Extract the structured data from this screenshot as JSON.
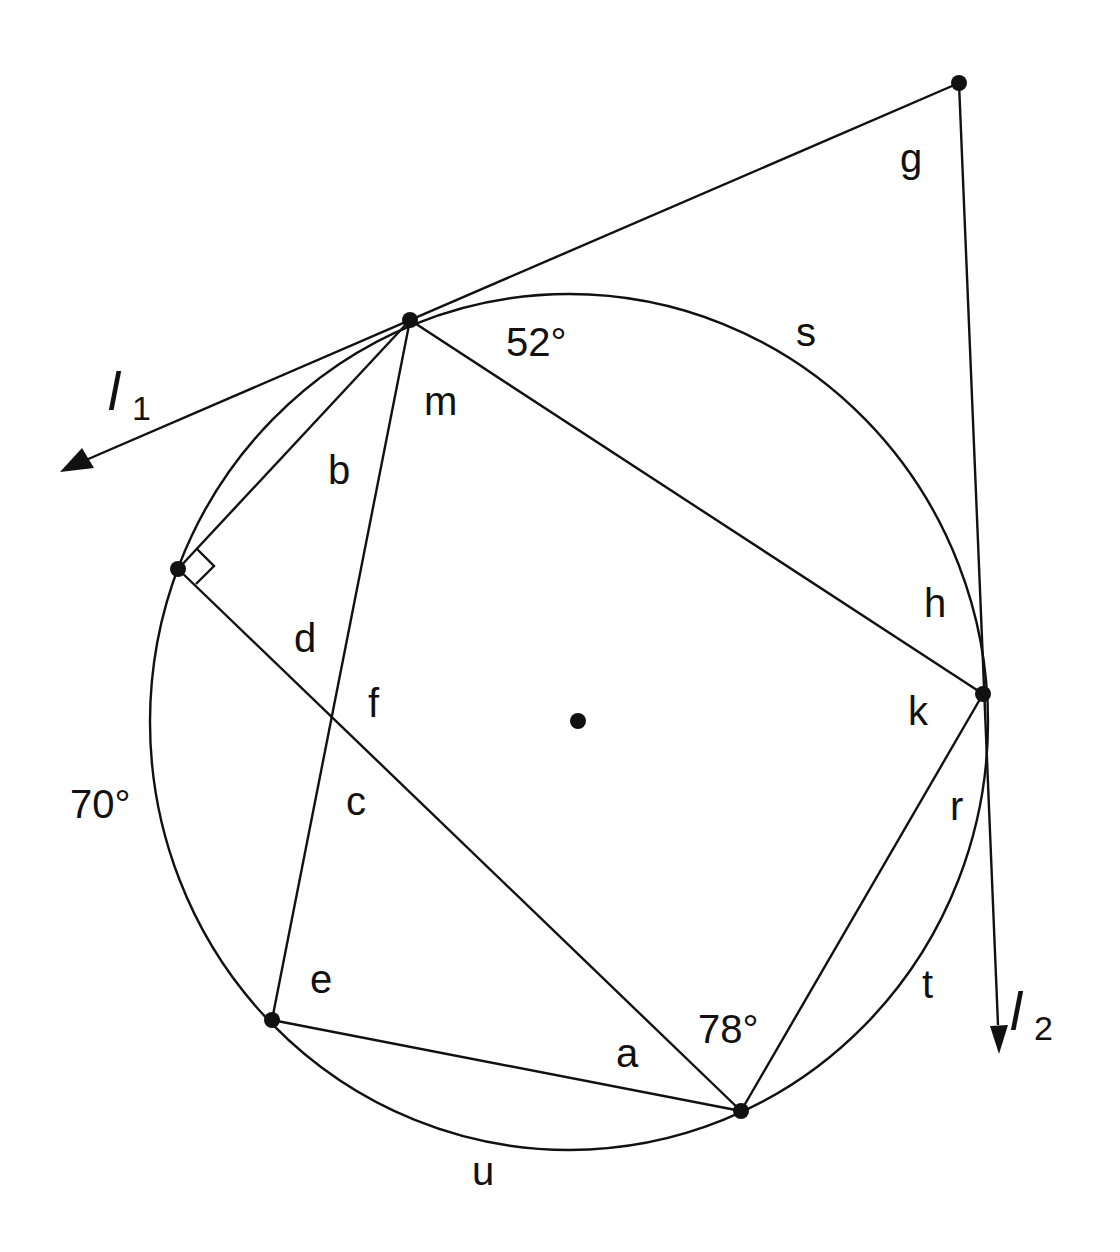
{
  "diagram": {
    "type": "circle-geometry",
    "circle": {
      "cx": 569,
      "cy": 722,
      "rx": 419,
      "ry": 428
    },
    "center_point": {
      "x": 578,
      "y": 721
    },
    "points": {
      "T1": {
        "x": 410,
        "y": 320
      },
      "G": {
        "x": 959,
        "y": 83
      },
      "P": {
        "x": 178,
        "y": 569
      },
      "T2": {
        "x": 983,
        "y": 694
      },
      "E": {
        "x": 272,
        "y": 1020
      },
      "B": {
        "x": 741,
        "y": 1111
      }
    },
    "tangent_lines": [
      {
        "name": "l1",
        "label_main": "l",
        "label_sub": "1"
      },
      {
        "name": "l2",
        "label_main": "l",
        "label_sub": "2"
      }
    ],
    "angle_labels": {
      "a": "a",
      "b": "b",
      "c": "c",
      "d": "d",
      "e": "e",
      "f": "f",
      "g": "g",
      "h": "h",
      "k": "k",
      "m": "m",
      "r": "r"
    },
    "arc_labels": {
      "s": "s",
      "t": "t",
      "u": "u"
    },
    "given_values": {
      "arc_top": "52°",
      "arc_left": "70°",
      "angle_bottom": "78°"
    },
    "right_angle_marker": "at P between chord P–T1 and chord P–B"
  }
}
